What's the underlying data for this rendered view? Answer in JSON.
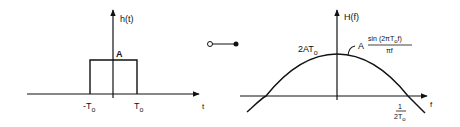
{
  "left_plot": {
    "y_axis_label": "h(t)",
    "x_axis_label": "t",
    "amplitude_label": "A",
    "left_tick": "-T",
    "left_tick_sub": "o",
    "right_tick": "T",
    "right_tick_sub": "o"
  },
  "connector": {
    "description": "Fourier transform pair symbol"
  },
  "right_plot": {
    "y_axis_label": "H(f)",
    "x_axis_label": "f",
    "peak_label": "2AT",
    "peak_label_sub": "o",
    "formula_prefix": "A",
    "formula_numerator": "sin (2πT",
    "formula_numerator_sub": "o",
    "formula_numerator_tail": "f)",
    "formula_denominator": "πf",
    "zero_tick_numerator": "1",
    "zero_tick_denominator": "2T",
    "zero_tick_denominator_sub": "o"
  },
  "colors": {
    "ink": "#111111",
    "background": "#ffffff"
  }
}
